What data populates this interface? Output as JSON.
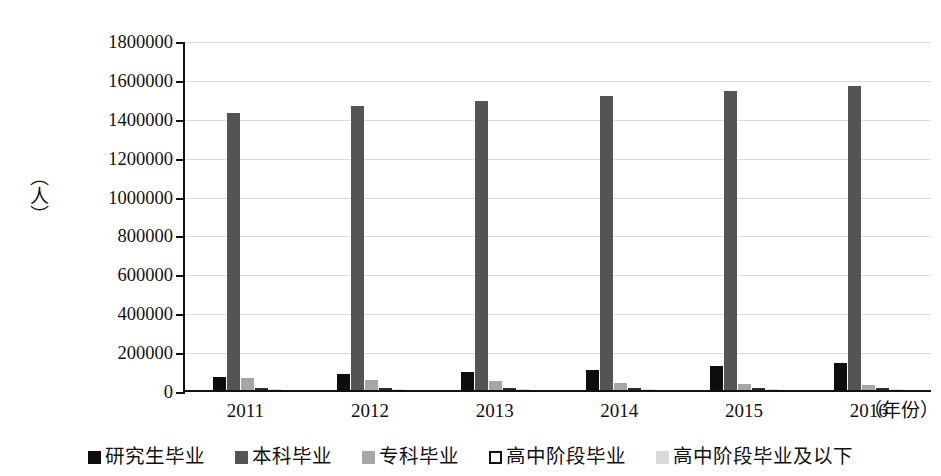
{
  "chart_data": {
    "type": "bar",
    "title": "",
    "xlabel": "（年份）",
    "ylabel": "（人）",
    "ylim": [
      0,
      1800000
    ],
    "ytick_step": 200000,
    "yticks": [
      "0",
      "200000",
      "400000",
      "600000",
      "800000",
      "1000000",
      "1200000",
      "1400000",
      "1600000",
      "1800000"
    ],
    "grid": true,
    "legend_position": "bottom",
    "categories": [
      "2011",
      "2012",
      "2013",
      "2014",
      "2015",
      "2016"
    ],
    "series": [
      {
        "name": "研究生毕业",
        "color": "#0d0d0d",
        "values": [
          65000,
          80000,
          93000,
          105000,
          122000,
          140000
        ]
      },
      {
        "name": "本科毕业",
        "color": "#545454",
        "values": [
          1425000,
          1460000,
          1485000,
          1512000,
          1538000,
          1565000
        ]
      },
      {
        "name": "专科毕业",
        "color": "#a6a6a6",
        "values": [
          62000,
          50000,
          44000,
          36000,
          30000,
          25000
        ]
      },
      {
        "name": "高中阶段毕业",
        "color": "#ffffff",
        "values": [
          9000,
          8000,
          7000,
          6000,
          5500,
          5000
        ]
      },
      {
        "name": "高中阶段毕业及以下",
        "color": "#dadada",
        "values": [
          7000,
          6000,
          5000,
          4500,
          4000,
          3500
        ]
      }
    ]
  },
  "legend": {
    "items": [
      {
        "label": "研究生毕业",
        "swatch": "#0d0d0d"
      },
      {
        "label": "本科毕业",
        "swatch": "#545454"
      },
      {
        "label": "专科毕业",
        "swatch": "#a6a6a6"
      },
      {
        "label": "高中阶段毕业",
        "swatch": "#ffffff"
      },
      {
        "label": "高中阶段毕业及以下",
        "swatch": "#dadada"
      }
    ]
  }
}
